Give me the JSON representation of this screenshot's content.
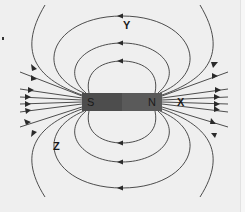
{
  "diagram": {
    "magnet": {
      "south_label": "S",
      "north_label": "N",
      "colors": {
        "body": "#555555",
        "south_end": "#4a4a4a",
        "north_end": "#5e5e5e"
      }
    },
    "point_labels": [
      {
        "id": "Y",
        "text": "Y"
      },
      {
        "id": "X",
        "text": "X"
      },
      {
        "id": "Z",
        "text": "Z"
      }
    ],
    "colors": {
      "background": "#efefef",
      "field_line": "#3a3a3a"
    }
  }
}
